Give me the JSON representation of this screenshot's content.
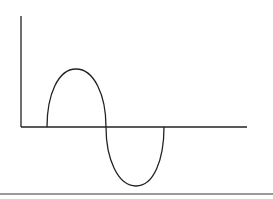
{
  "diagram": {
    "type": "sine-wave-single-cycle",
    "colors": {
      "background": "#ffffff",
      "stroke": "#222222",
      "divider": "#9a9a9a"
    },
    "axes": {
      "origin": [
        21,
        127
      ],
      "y_axis_top": [
        21,
        16
      ],
      "x_axis_end": [
        247,
        127
      ]
    },
    "wave": {
      "start": [
        47,
        127
      ],
      "peak": [
        76,
        69
      ],
      "zero_crossing": [
        106,
        127
      ],
      "trough": [
        136,
        186
      ],
      "end": [
        164,
        127
      ]
    },
    "labels": []
  }
}
